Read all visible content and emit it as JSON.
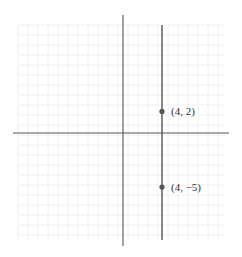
{
  "chart_data": {
    "type": "line",
    "title": "",
    "xlabel": "",
    "ylabel": "",
    "grid": true,
    "legend": null,
    "series": [
      {
        "name": "x = 4",
        "x": [
          4,
          4
        ],
        "y": [
          -8,
          11
        ],
        "color": "#555555"
      }
    ],
    "points": [
      {
        "x": 4,
        "y": 2,
        "label": "(4, 2)"
      },
      {
        "x": 4,
        "y": -5,
        "label": "(4, −5)"
      }
    ],
    "xlim": [
      -11,
      11
    ],
    "ylim": [
      -10,
      11
    ]
  },
  "colors": {
    "axis": "#555555",
    "line": "#555555",
    "point": "#555555",
    "grid": "#f0f0f0"
  }
}
